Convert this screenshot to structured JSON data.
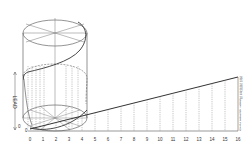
{
  "diagram": {
    "type": "helix-development",
    "dimension_label": "LEAD",
    "base_labels": [
      "0",
      "1",
      "2",
      "3",
      "4",
      "5",
      "6",
      "7",
      "8",
      "9",
      "10",
      "11",
      "12",
      "13",
      "14",
      "15",
      "16"
    ],
    "base_labels_left": [
      "0",
      "0"
    ],
    "right_scale_labels": [
      "16",
      "15",
      "14",
      "13",
      "12",
      "11",
      "10",
      "9",
      "8",
      "7",
      "6",
      "5",
      "4",
      "3",
      "2",
      "1",
      "0"
    ],
    "colors": {
      "line": "#555555",
      "helix": "#333333",
      "dashed": "#888888",
      "text": "#333333",
      "background": "#ffffff"
    }
  }
}
